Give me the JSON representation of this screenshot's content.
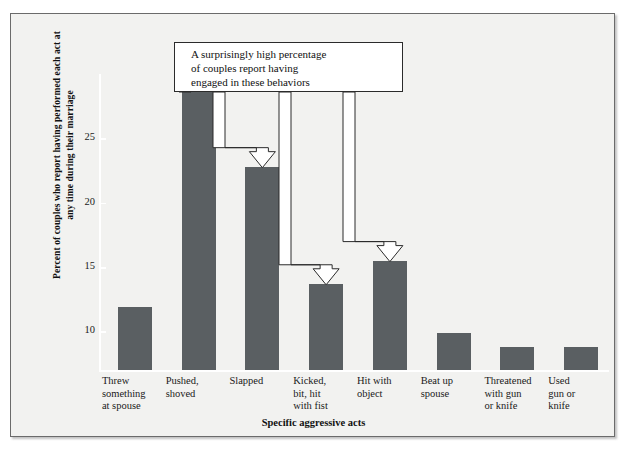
{
  "figure": {
    "background_color": "#f2f2f0",
    "border_color": "#6b6b6b",
    "bar_color": "#5a5f62",
    "axis_color": "#ffffff"
  },
  "callout": {
    "name": "annotation-callout",
    "text": "A surprisingly high percentage\nof couples report having\nengaged in these behaviors"
  },
  "chart_data": {
    "type": "bar",
    "title": "",
    "subtitle": "",
    "xlabel": "Specific aggressive acts",
    "ylabel": "Percent of couples who report having performed each act at any time during their marriage",
    "categories": [
      "Threw something at spouse",
      "Pushed, shoved",
      "Slapped",
      "Kicked, bit, hit with fist",
      "Hit with object",
      "Beat up spouse",
      "Threatened with gun or knife",
      "Used gun or knife"
    ],
    "category_lines": [
      [
        "Threw",
        "something",
        "at spouse"
      ],
      [
        "Pushed,",
        "shoved"
      ],
      [
        "Slapped"
      ],
      [
        "Kicked,",
        "bit, hit",
        "with fist"
      ],
      [
        "Hit with",
        "object"
      ],
      [
        "Beat up",
        "spouse"
      ],
      [
        "Threatened",
        "with gun",
        "or knife"
      ],
      [
        "Used",
        "gun or",
        "knife"
      ]
    ],
    "values": [
      11.9,
      28.7,
      22.8,
      13.7,
      15.5,
      9.9,
      8.8,
      8.8
    ],
    "ylim": [
      7.0,
      30.0
    ],
    "yticks": [
      10,
      15,
      20,
      25
    ],
    "ytick_labels": [
      "10",
      "15",
      "20",
      "25"
    ],
    "grid": false,
    "legend": null,
    "annotations": [
      {
        "text": "A surprisingly high percentage of couples report having engaged in these behaviors",
        "points_to": [
          "Pushed, shoved",
          "Slapped",
          "Kicked, bit, hit with fist",
          "Hit with object"
        ]
      }
    ]
  }
}
